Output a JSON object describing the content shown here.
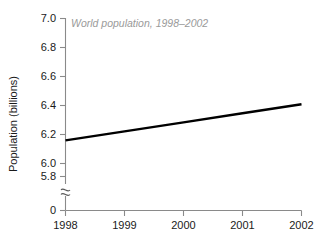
{
  "chart_data": {
    "type": "line",
    "title": "World population, 1998–2002",
    "xlabel": "",
    "ylabel": "Population (billions)",
    "x": [
      1998,
      1999,
      2000,
      2001,
      2002
    ],
    "categories": [
      "1998",
      "1999",
      "2000",
      "2001",
      "2002"
    ],
    "values": [
      5.92,
      6.0,
      6.08,
      6.16,
      6.24
    ],
    "series": [
      {
        "name": "World population",
        "values": [
          5.92,
          6.0,
          6.08,
          6.16,
          6.24
        ]
      }
    ],
    "ylim": [
      5.6,
      7.0
    ],
    "xlim": [
      1998,
      2002
    ],
    "y_ticks": [
      "0",
      "5.6",
      "5.8",
      "6.0",
      "6.2",
      "6.4",
      "6.6",
      "6.8",
      "7.0"
    ],
    "y_tick_values": [
      0,
      5.6,
      5.8,
      6.0,
      6.2,
      6.4,
      6.6,
      6.8,
      7.0
    ],
    "x_ticks": [
      "1998",
      "1999",
      "2000",
      "2001",
      "2002"
    ],
    "grid": false,
    "legend": "none",
    "axis_break": true,
    "axis_break_symbol": "≋",
    "line_color": "#000000",
    "title_color": "#9a9a9a",
    "axis_color": "#8a8a8a",
    "background_color": "#ffffff"
  },
  "labels": {
    "y_axis_title": "Population (billions)",
    "chart_title": "World population, 1998–2002",
    "y_7_0": "7.0",
    "y_6_8": "6.8",
    "y_6_6": "6.6",
    "y_6_4": "6.4",
    "y_6_2": "6.2",
    "y_6_0": "6.0",
    "y_5_8": "5.8",
    "y_5_6": "5.6",
    "y_zero": "0",
    "x_1998": "1998",
    "x_1999": "1999",
    "x_2000": "2000",
    "x_2001": "2001",
    "x_2002": "2002"
  }
}
